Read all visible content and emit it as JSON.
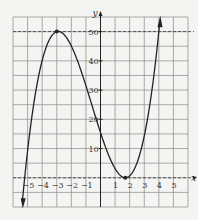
{
  "chart_data": {
    "type": "line",
    "title": "",
    "xlabel": "x",
    "ylabel": "y",
    "xlim": [
      -6,
      6
    ],
    "ylim": [
      -10,
      55
    ],
    "grid": true,
    "x_ticks": [
      "-5",
      "-4",
      "-3",
      "-2",
      "-1",
      "1",
      "2",
      "3",
      "4",
      "5"
    ],
    "y_ticks": [
      "10",
      "20",
      "30",
      "40",
      "50"
    ],
    "series": [
      {
        "name": "f(x)",
        "description": "cubic curve with local max near (-3, 50) and local min near (1.7, 0)",
        "x": [
          -5.3,
          -5,
          -4.5,
          -4,
          -3.5,
          -3,
          -2.5,
          -2,
          -1.5,
          -1,
          -0.5,
          0,
          0.5,
          1,
          1.5,
          1.7,
          2,
          2.5,
          3,
          3.5,
          4.1
        ],
        "y": [
          -10,
          0,
          20,
          38,
          48,
          50,
          47,
          41,
          33,
          25,
          17,
          12,
          5,
          2,
          0.2,
          0,
          0.6,
          4,
          11,
          25,
          55
        ]
      }
    ],
    "reference_lines": [
      {
        "type": "horizontal",
        "y": 50,
        "style": "dashed"
      },
      {
        "type": "horizontal",
        "y": 0,
        "style": "dashed"
      }
    ],
    "marked_points": [
      {
        "x": -3,
        "y": 50
      },
      {
        "x": 1.7,
        "y": 0
      }
    ]
  }
}
